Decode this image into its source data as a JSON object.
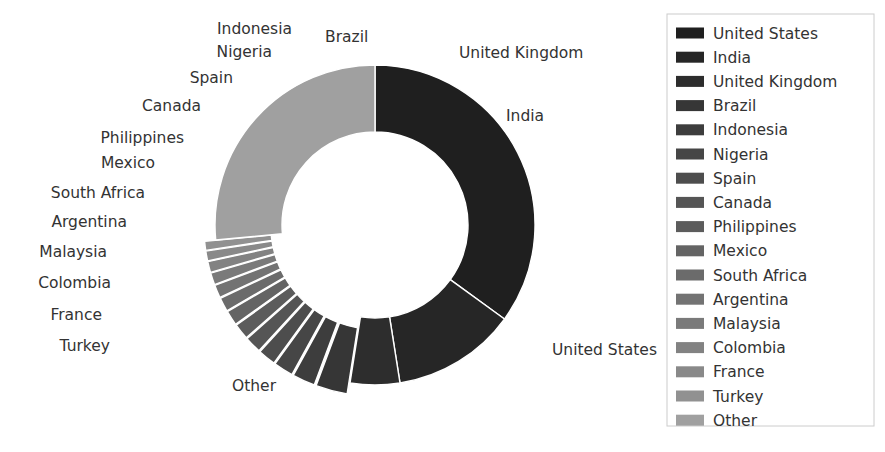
{
  "chart_data": {
    "type": "pie",
    "title": "",
    "subtitle": "",
    "xlabel": "",
    "ylabel": "",
    "donut": true,
    "hole_fraction": 0.58,
    "exploded": true,
    "legend_position": "right",
    "grid": false,
    "start_angle_deg": 90,
    "direction": "clockwise",
    "labels": [
      "United States",
      "India",
      "United Kingdom",
      "Brazil",
      "Indonesia",
      "Nigeria",
      "Spain",
      "Canada",
      "Philippines",
      "Mexico",
      "South Africa",
      "Argentina",
      "Malaysia",
      "Colombia",
      "France",
      "Turkey",
      "Other"
    ],
    "values": [
      35.0,
      12.5,
      5.0,
      3.2,
      2.3,
      2.0,
      1.8,
      1.7,
      1.6,
      1.5,
      1.4,
      1.3,
      1.2,
      1.1,
      1.0,
      0.9,
      26.5
    ],
    "colors": [
      "#1f1f1f",
      "#262626",
      "#2d2d2d",
      "#363636",
      "#3d3d3d",
      "#464646",
      "#4d4d4d",
      "#555555",
      "#5c5c5c",
      "#646464",
      "#6b6b6b",
      "#737373",
      "#7a7a7a",
      "#828282",
      "#898989",
      "#919191",
      "#a0a0a0"
    ],
    "explode": [
      0,
      0,
      0,
      0.07,
      0.07,
      0.07,
      0.07,
      0.07,
      0.07,
      0.07,
      0.07,
      0.07,
      0.07,
      0.07,
      0.07,
      0.07,
      0
    ]
  },
  "slice_labels": [
    {
      "text": "United States",
      "x": 552,
      "y": 355,
      "anchor": "start"
    },
    {
      "text": "India",
      "x": 506,
      "y": 121,
      "anchor": "start"
    },
    {
      "text": "United Kingdom",
      "x": 459,
      "y": 58,
      "anchor": "start"
    },
    {
      "text": "Brazil",
      "x": 325,
      "y": 42,
      "anchor": "start"
    },
    {
      "text": "Indonesia",
      "x": 292,
      "y": 34,
      "anchor": "end"
    },
    {
      "text": "Nigeria",
      "x": 272,
      "y": 57,
      "anchor": "end"
    },
    {
      "text": "Spain",
      "x": 233,
      "y": 83,
      "anchor": "end"
    },
    {
      "text": "Canada",
      "x": 201,
      "y": 111,
      "anchor": "end"
    },
    {
      "text": "Philippines",
      "x": 184,
      "y": 143,
      "anchor": "end"
    },
    {
      "text": "Mexico",
      "x": 155,
      "y": 168,
      "anchor": "end"
    },
    {
      "text": "South Africa",
      "x": 145,
      "y": 198,
      "anchor": "end"
    },
    {
      "text": "Argentina",
      "x": 127,
      "y": 227,
      "anchor": "end"
    },
    {
      "text": "Malaysia",
      "x": 107,
      "y": 257,
      "anchor": "end"
    },
    {
      "text": "Colombia",
      "x": 111,
      "y": 288,
      "anchor": "end"
    },
    {
      "text": "France",
      "x": 102,
      "y": 320,
      "anchor": "end"
    },
    {
      "text": "Turkey",
      "x": 110,
      "y": 351,
      "anchor": "end"
    },
    {
      "text": "Other",
      "x": 232,
      "y": 391,
      "anchor": "start"
    }
  ],
  "legend": {
    "x": 667,
    "y": 14,
    "width": 207,
    "height": 412,
    "row_height": 24.2,
    "swatch_x": 676,
    "swatch_width": 28,
    "swatch_height": 11,
    "text_x": 713,
    "first_row_y": 33,
    "items": [
      {
        "label": "United States",
        "color": "#1f1f1f"
      },
      {
        "label": "India",
        "color": "#262626"
      },
      {
        "label": "United Kingdom",
        "color": "#2d2d2d"
      },
      {
        "label": "Brazil",
        "color": "#363636"
      },
      {
        "label": "Indonesia",
        "color": "#3d3d3d"
      },
      {
        "label": "Nigeria",
        "color": "#464646"
      },
      {
        "label": "Spain",
        "color": "#4d4d4d"
      },
      {
        "label": "Canada",
        "color": "#555555"
      },
      {
        "label": "Philippines",
        "color": "#5c5c5c"
      },
      {
        "label": "Mexico",
        "color": "#646464"
      },
      {
        "label": "South Africa",
        "color": "#6b6b6b"
      },
      {
        "label": "Argentina",
        "color": "#737373"
      },
      {
        "label": "Malaysia",
        "color": "#7a7a7a"
      },
      {
        "label": "Colombia",
        "color": "#828282"
      },
      {
        "label": "France",
        "color": "#898989"
      },
      {
        "label": "Turkey",
        "color": "#919191"
      },
      {
        "label": "Other",
        "color": "#a0a0a0"
      }
    ]
  },
  "geometry": {
    "center_x": 375,
    "center_y": 225,
    "outer_radius": 160,
    "inner_radius": 93
  },
  "colors": {
    "background": "#ffffff",
    "text": "#333333",
    "legend_border": "#cccccc"
  }
}
